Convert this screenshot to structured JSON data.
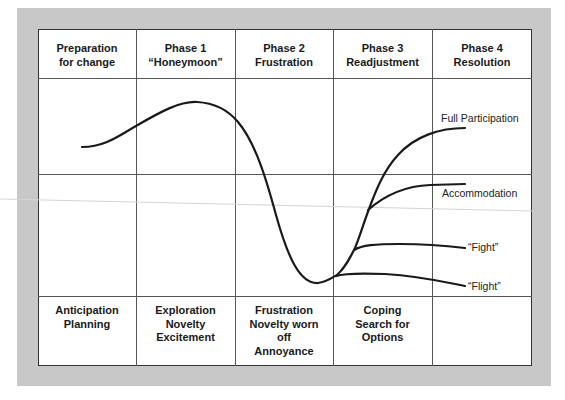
{
  "diagram": {
    "columns": [
      {
        "header_line1": "Preparation",
        "header_line2": "for change",
        "footer": [
          "Anticipation",
          "Planning"
        ]
      },
      {
        "header_line1": "Phase 1",
        "header_line2": "“Honeymoon”",
        "footer": [
          "Exploration",
          "Novelty",
          "Excitement"
        ]
      },
      {
        "header_line1": "Phase 2",
        "header_line2": "Frustration",
        "footer": [
          "Frustration",
          "Novelty worn",
          "off",
          "Annoyance"
        ]
      },
      {
        "header_line1": "Phase 3",
        "header_line2": "Readjustment",
        "footer": [
          "Coping",
          "Search for",
          "Options"
        ]
      },
      {
        "header_line1": "Phase 4",
        "header_line2": "Resolution",
        "footer": []
      }
    ],
    "outcomes": [
      {
        "label": "Full Participation",
        "end_y": 128
      },
      {
        "label": "Accommodation",
        "end_y": 184
      },
      {
        "label": "“Fight”",
        "end_y": 248
      },
      {
        "label": "“Flight”",
        "end_y": 286
      }
    ],
    "curve_points": {
      "start": [
        82,
        147
      ],
      "peak": [
        195,
        102
      ],
      "trough": [
        318,
        283
      ],
      "branch_end_x": 465
    },
    "colors": {
      "frame": "#c8c8c8",
      "table_bg": "#ffffff",
      "grid": "#555555",
      "curve": "#1a1a1a",
      "text": "#1a1a1a"
    }
  }
}
